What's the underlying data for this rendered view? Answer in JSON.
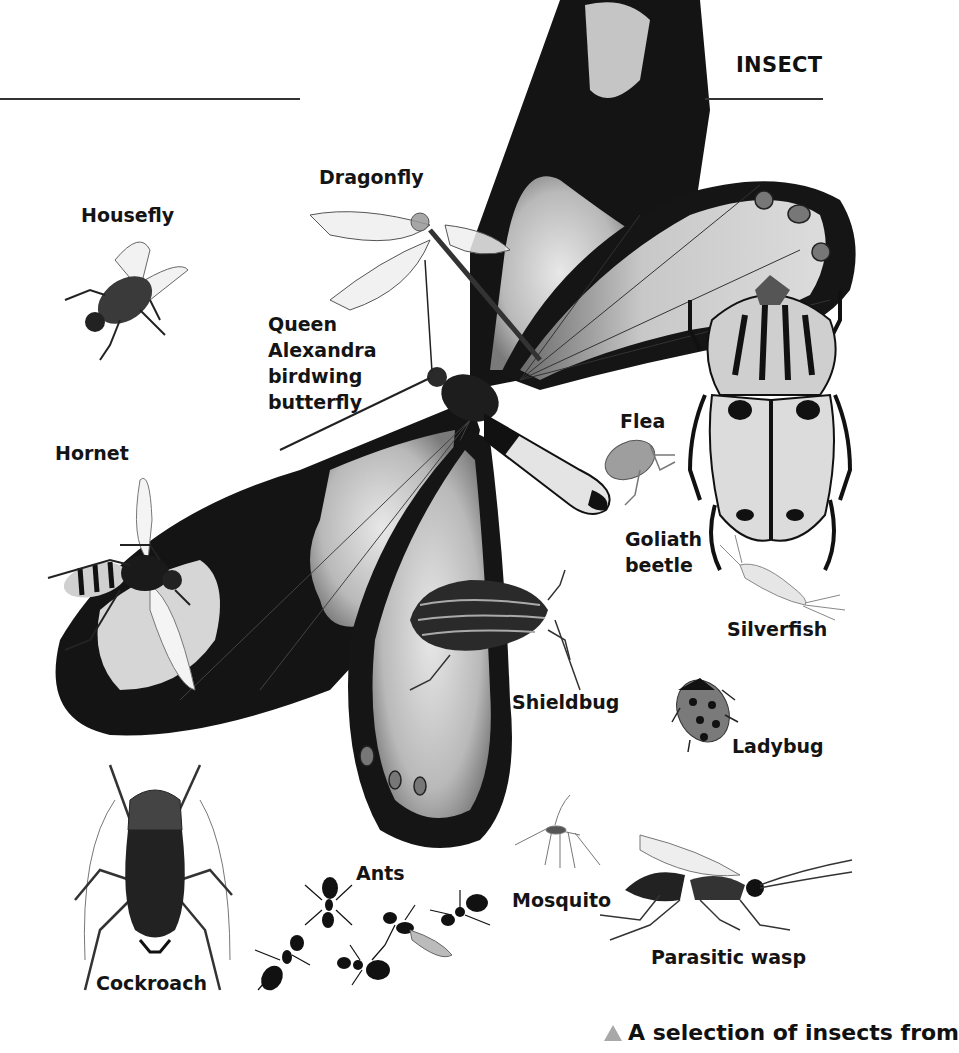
{
  "header": {
    "section_title": "INSECT"
  },
  "labels": {
    "housefly": "Housefly",
    "dragonfly": "Dragonfly",
    "birdwing": [
      "Queen",
      "Alexandra",
      "birdwing",
      "butterfly"
    ],
    "hornet": "Hornet",
    "flea": "Flea",
    "goliath": [
      "Goliath",
      "beetle"
    ],
    "silverfish": "Silverfish",
    "shieldbug": "Shieldbug",
    "ladybug": "Ladybug",
    "cockroach": "Cockroach",
    "ants": "Ants",
    "mosquito": "Mosquito",
    "parasitic_wasp": "Parasitic wasp"
  },
  "caption": {
    "icon": "triangle-up-icon",
    "text": "A selection of insects from"
  },
  "colors": {
    "ink": "#111111",
    "wing_dark": "#151515",
    "wing_light": "#c8c8c8",
    "caption_triangle": "#a8a8a8",
    "rule": "#333333"
  }
}
